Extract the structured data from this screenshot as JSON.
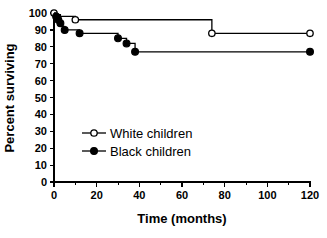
{
  "chart_data": {
    "type": "line",
    "title": "",
    "subtitle": "",
    "xlabel": "Time (months)",
    "ylabel": "Percent surviving",
    "xlim": [
      0,
      120
    ],
    "ylim": [
      0,
      100
    ],
    "xticks": [
      0,
      20,
      40,
      60,
      80,
      100,
      120
    ],
    "xtick_labels": [
      "0",
      "20",
      "40",
      "60",
      "80",
      "100",
      "120"
    ],
    "xminor_ticks": [
      10,
      30,
      50,
      70,
      90,
      110
    ],
    "yticks": [
      0,
      10,
      20,
      30,
      40,
      50,
      60,
      70,
      80,
      90,
      100
    ],
    "ytick_labels": [
      "0",
      "10",
      "20",
      "30",
      "40",
      "50",
      "60",
      "70",
      "80",
      "90",
      "100"
    ],
    "grid": false,
    "legend_position": "inside-left-lower",
    "plot_style": "step-post",
    "series": [
      {
        "name": "White children",
        "marker": "open-circle",
        "color": "#000000",
        "x": [
          0,
          1,
          3,
          10,
          74,
          120
        ],
        "y": [
          100,
          99,
          98,
          96,
          88,
          88
        ],
        "marker_points": [
          {
            "x": 0,
            "y": 100
          },
          {
            "x": 10,
            "y": 96
          },
          {
            "x": 74,
            "y": 88
          },
          {
            "x": 120,
            "y": 88
          }
        ]
      },
      {
        "name": "Black children",
        "marker": "filled-circle",
        "color": "#000000",
        "x": [
          0,
          1,
          2,
          3,
          4,
          5,
          12,
          30,
          34,
          38,
          120
        ],
        "y": [
          100,
          98,
          96,
          94,
          92,
          90,
          88,
          85,
          82,
          77,
          77
        ],
        "marker_points": [
          {
            "x": 1,
            "y": 98
          },
          {
            "x": 2,
            "y": 96
          },
          {
            "x": 3,
            "y": 94
          },
          {
            "x": 5,
            "y": 90
          },
          {
            "x": 12,
            "y": 88
          },
          {
            "x": 30,
            "y": 85
          },
          {
            "x": 34,
            "y": 82
          },
          {
            "x": 38,
            "y": 77
          },
          {
            "x": 120,
            "y": 77
          }
        ]
      }
    ]
  },
  "legend": {
    "entries": [
      {
        "label": "White children",
        "marker": "open-circle"
      },
      {
        "label": "Black children",
        "marker": "filled-circle"
      }
    ]
  },
  "colors": {
    "ink": "#000000",
    "background": "#ffffff"
  }
}
